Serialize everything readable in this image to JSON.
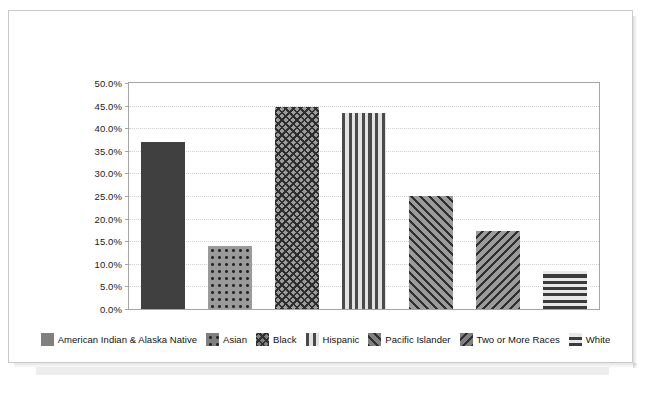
{
  "chart_data": {
    "type": "bar",
    "title": "",
    "xlabel": "",
    "ylabel": "",
    "grid": true,
    "legend_position": "bottom",
    "ylim": [
      0,
      50
    ],
    "ytick_labels": [
      "50.0%",
      "45.0%",
      "40.0%",
      "35.0%",
      "30.0%",
      "25.0%",
      "20.0%",
      "15.0%",
      "10.0%",
      "5.0%",
      "0.0%"
    ],
    "ytick_values": [
      50,
      45,
      40,
      35,
      30,
      25,
      20,
      15,
      10,
      5,
      0
    ],
    "categories": [
      "American Indian & Alaska Native",
      "Asian",
      "Black",
      "Hispanic",
      "Pacific Islander",
      "Two or More Races",
      "White"
    ],
    "values": [
      37.0,
      14.0,
      44.7,
      43.3,
      25.0,
      17.2,
      8.5
    ],
    "value_labels": [
      "37.0%",
      "14.0%",
      "44.7%",
      "43.3%",
      "25.0%",
      "17.2%",
      "8.5%"
    ],
    "patterns": [
      "solid",
      "dots",
      "checker",
      "vertical-stripes",
      "diagonal-forward",
      "diagonal-backward",
      "horizontal-stripes"
    ],
    "colors": [
      "#404040",
      "#9a9a9a",
      "#9b9b9b",
      "#4a4a4a",
      "#9b9b9b",
      "#9b9b9b",
      "#3b3b3b"
    ]
  },
  "legend": {
    "items": [
      {
        "label": "American Indian & Alaska Native",
        "pattern": "solid"
      },
      {
        "label": "Asian",
        "pattern": "dots"
      },
      {
        "label": "Black",
        "pattern": "checker"
      },
      {
        "label": "Hispanic",
        "pattern": "vertical-stripes"
      },
      {
        "label": "Pacific Islander",
        "pattern": "diagonal-forward"
      },
      {
        "label": "Two or More Races",
        "pattern": "diagonal-backward"
      },
      {
        "label": "White",
        "pattern": "horizontal-stripes"
      }
    ]
  }
}
